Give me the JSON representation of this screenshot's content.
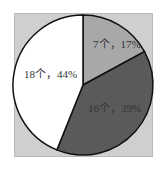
{
  "chart_data": {
    "type": "pie",
    "title": "",
    "categories": [
      "A",
      "B",
      "C"
    ],
    "values": [
      7,
      16,
      18
    ],
    "percentages": [
      17,
      39,
      44
    ],
    "labels": [
      "7个，17%",
      "16个，39%",
      "18个，44%"
    ],
    "colors": [
      "#a8a8a8",
      "#5a5a5a",
      "#ffffff"
    ],
    "start_angle": "12 o'clock, clockwise",
    "legend": "none"
  },
  "background_color": "#cfcfcf"
}
